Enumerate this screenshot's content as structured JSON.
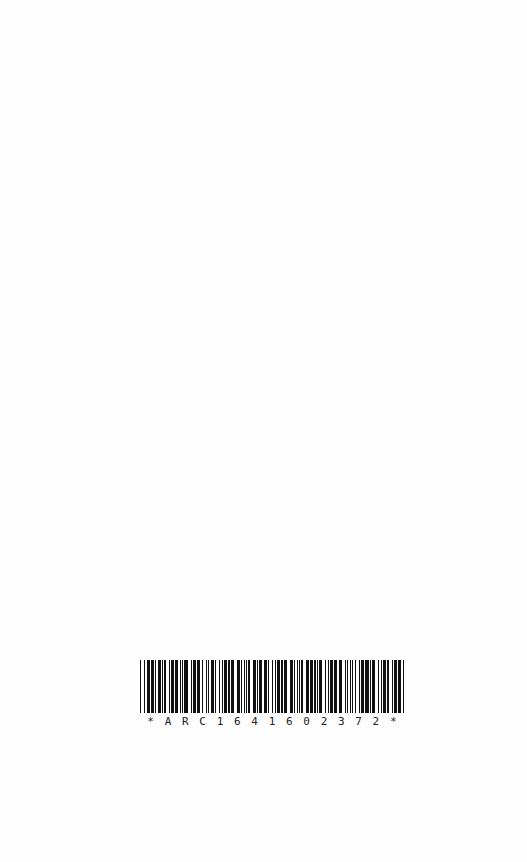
{
  "page": {
    "background": "#fefefe"
  },
  "barcode": {
    "symbology": "Code 39",
    "value": "ARC164160237 2",
    "human_readable": "*ARC164160237 2*",
    "caption_chars": [
      "*",
      "A",
      "R",
      "C",
      "1",
      "6",
      "4",
      "1",
      "6",
      "0",
      "2",
      "3",
      "7",
      "2",
      "*"
    ],
    "bar_color": "#111111"
  }
}
